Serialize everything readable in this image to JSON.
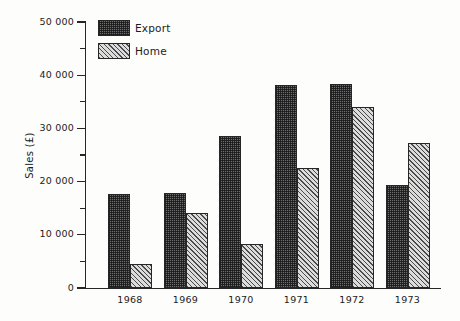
{
  "chart_data": {
    "type": "bar",
    "title": "",
    "subtitle": "",
    "xlabel": "",
    "ylabel": "Sales (£)",
    "categories": [
      "1968",
      "1969",
      "1970",
      "1971",
      "1972",
      "1973"
    ],
    "series": [
      {
        "name": "Export",
        "values": [
          17700,
          17900,
          28600,
          38200,
          38400,
          19400
        ],
        "fill": "dark-stipple",
        "color": "#6e6e6e"
      },
      {
        "name": "Home",
        "values": [
          4500,
          14100,
          8300,
          22500,
          34100,
          27200
        ],
        "fill": "diagonal-hatch",
        "color": "#dcdcdc"
      }
    ],
    "ylim": [
      0,
      50000
    ],
    "ytick_values": [
      0,
      10000,
      20000,
      30000,
      40000,
      50000
    ],
    "ytick_labels": [
      "0",
      "10 000",
      "20 000",
      "30 000",
      "40 000",
      "50 000"
    ],
    "yminor_tick_values": [
      5000,
      15000,
      25000,
      35000,
      45000
    ],
    "grid": false,
    "legend_position": "top-left-inside",
    "axis_color": "#272727",
    "background_color": "#fdfdfc"
  },
  "legend": {
    "items": [
      {
        "label": "Export"
      },
      {
        "label": "Home"
      }
    ]
  }
}
